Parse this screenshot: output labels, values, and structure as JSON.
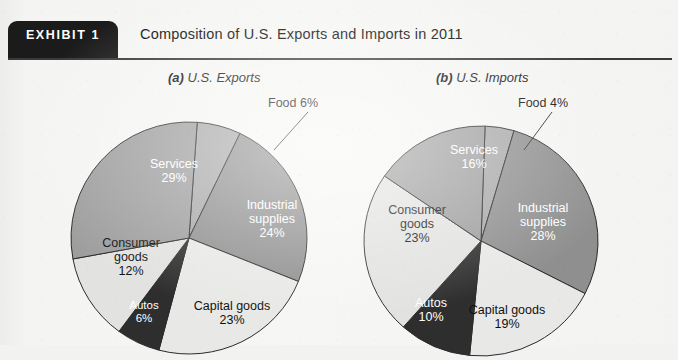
{
  "header": {
    "exhibit_tab": "EXHIBIT 1",
    "title": "Composition of U.S. Exports and Imports in 2011"
  },
  "charts": {
    "exports": {
      "caption_prefix": "(a)",
      "caption_text": " U.S. Exports",
      "callout": "Food 6%",
      "labels": {
        "services_name": "Services",
        "services_value": "29%",
        "industrial_name_1": "Industrial",
        "industrial_name_2": "supplies",
        "industrial_value": "24%",
        "capital_name": "Capital goods",
        "capital_value": "23%",
        "autos_name": "Autos",
        "autos_value": "6%",
        "consumer_name_1": "Consumer",
        "consumer_name_2": "goods",
        "consumer_value": "12%"
      }
    },
    "imports": {
      "caption_prefix": "(b)",
      "caption_text": " U.S. Imports",
      "callout": "Food 4%",
      "labels": {
        "services_name": "Services",
        "services_value": "16%",
        "industrial_name_1": "Industrial",
        "industrial_name_2": "supplies",
        "industrial_value": "28%",
        "capital_name": "Capital goods",
        "capital_value": "19%",
        "autos_name": "Autos",
        "autos_value": "10%",
        "consumer_name_1": "Consumer",
        "consumer_name_2": "goods",
        "consumer_value": "23%"
      }
    }
  },
  "colors": {
    "food": "#a8a8a8",
    "industrial": "#8f8f8f",
    "capital": "#e8e8e6",
    "autos": "#2e2e2e",
    "consumer": "#e2e2e0",
    "services": "#9e9e9e",
    "outline": "#2b2b2b",
    "paper": "#f4f4f2",
    "ink": "#111111"
  },
  "chart_data": [
    {
      "type": "pie",
      "title": "(a) U.S. Exports",
      "categories": [
        "Food",
        "Industrial supplies",
        "Capital goods",
        "Autos",
        "Consumer goods",
        "Services"
      ],
      "values": [
        6,
        24,
        23,
        6,
        12,
        29
      ],
      "unit": "percent",
      "legend": "none",
      "labels_inside": true
    },
    {
      "type": "pie",
      "title": "(b) U.S. Imports",
      "categories": [
        "Food",
        "Industrial supplies",
        "Capital goods",
        "Autos",
        "Consumer goods",
        "Services"
      ],
      "values": [
        4,
        28,
        19,
        10,
        23,
        16
      ],
      "unit": "percent",
      "legend": "none",
      "labels_inside": true
    }
  ]
}
